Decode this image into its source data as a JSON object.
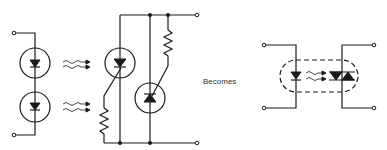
{
  "diagram": {
    "type": "circuit-schematic",
    "left_circuit": {
      "components": [
        {
          "id": "led-1",
          "type": "photodiode/LED in circle"
        },
        {
          "id": "led-2",
          "type": "photodiode/LED in circle"
        },
        {
          "id": "light-rays-1",
          "type": "light emission arrows"
        },
        {
          "id": "light-rays-2",
          "type": "light emission arrows"
        },
        {
          "id": "scr",
          "type": "light-activated SCR in circle"
        },
        {
          "id": "gate-resistor",
          "type": "resistor"
        },
        {
          "id": "triac",
          "type": "triac in circle"
        },
        {
          "id": "triac-gate-resistor",
          "type": "resistor"
        }
      ],
      "terminals": 4
    },
    "label": "Becomes",
    "right_circuit": {
      "components": [
        {
          "id": "led",
          "type": "LED"
        },
        {
          "id": "light-rays",
          "type": "light emission arrows"
        },
        {
          "id": "triac-output",
          "type": "triac"
        },
        {
          "id": "package-outline",
          "type": "dashed enclosure"
        }
      ],
      "terminals": 4
    },
    "colors": {
      "ink": "#1a1a1a",
      "background": "#ffffff"
    }
  }
}
